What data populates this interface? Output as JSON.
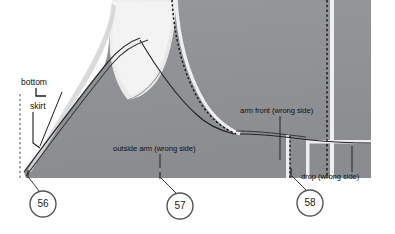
{
  "diagram": {
    "colors": {
      "background": "#ffffff",
      "fabric_dark": "#8f9194",
      "fabric_mid": "#d9dadb",
      "fabric_light": "#ececec",
      "fabric_lighter": "#f4f4f4",
      "seam_line": "#2b2b2b",
      "highlight": "#f2f2f2",
      "callout_stroke": "#4a4a4a",
      "text": "#111111"
    },
    "labels": [
      {
        "id": "bottom",
        "text": "bottom",
        "x": 22,
        "y": 82
      },
      {
        "id": "skirt",
        "text": "skirt",
        "x": 30,
        "y": 106
      },
      {
        "id": "arm-front",
        "text": "arm front (wrong side)",
        "x": 240,
        "y": 110
      },
      {
        "id": "outside-arm",
        "text": "outside arm (wrong side)",
        "x": 113,
        "y": 148
      },
      {
        "id": "drop",
        "text": "drop (wrong side)",
        "x": 301,
        "y": 176
      }
    ],
    "callouts": [
      {
        "id": "callout-56",
        "number": "56",
        "cx": 43,
        "cy": 204,
        "r": 13,
        "leader_x": 29,
        "leader_y": 178
      },
      {
        "id": "callout-57",
        "number": "57",
        "cx": 180,
        "cy": 206,
        "r": 13,
        "leader_x": 161,
        "leader_y": 180
      },
      {
        "id": "callout-58",
        "number": "58",
        "cx": 310,
        "cy": 203,
        "r": 13,
        "leader_x": 292,
        "leader_y": 176
      }
    ]
  }
}
